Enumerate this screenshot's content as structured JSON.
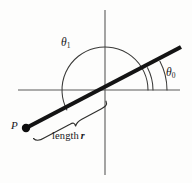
{
  "figure": {
    "background_color": "#fdfdfc",
    "width": 192,
    "height": 183,
    "labels": {
      "theta1_symbol": "θ",
      "theta1_subscript": "1",
      "theta0_symbol": "θ",
      "theta0_subscript": "0",
      "point_p": "P",
      "length_text": "length",
      "length_variable": "r"
    },
    "colors": {
      "axis": "#5a5a58",
      "ray": "#141414",
      "arc": "#3a3a38",
      "brace": "#2e2e2c",
      "point": "#0d0d0d",
      "text": "#16161a"
    },
    "geometry": {
      "origin_x": 105,
      "origin_y": 90,
      "x_axis_start_x": 18,
      "x_axis_end_x": 180,
      "y_axis_start_y": 10,
      "y_axis_end_y": 175,
      "ray_start_x": 26,
      "ray_start_y": 128,
      "ray_end_x": 181,
      "ray_end_y": 47,
      "point_p_x": 26,
      "point_p_y": 128,
      "point_p_radius": 4.2,
      "theta1_arc_radius": 43,
      "theta0_arc_radius_inner": 48,
      "theta0_arc_radius_outer": 62,
      "ray_angle_degrees": 27.6,
      "theta1_sweep_degrees": 207.6
    }
  }
}
